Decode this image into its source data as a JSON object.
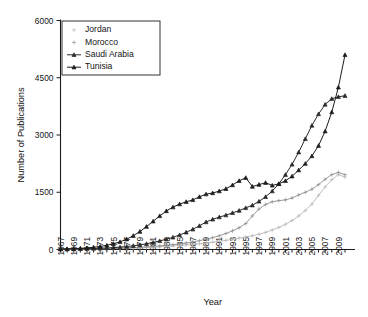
{
  "chart_data": {
    "type": "line",
    "title": "",
    "xlabel": "Year",
    "ylabel": "Number of Publications",
    "xlim": [
      1967,
      2010
    ],
    "ylim": [
      0,
      6000
    ],
    "grid": false,
    "legend_position": "top-left",
    "ytick_labels": [
      "0",
      "1500",
      "3000",
      "4500",
      "6000"
    ],
    "ytick_values": [
      0,
      1500,
      3000,
      4500,
      6000
    ],
    "xtick_labels": [
      "1967",
      "1969",
      "1971",
      "1973",
      "1975",
      "1977",
      "1979",
      "1981",
      "1983",
      "1985",
      "1987",
      "1989",
      "1991",
      "1993",
      "1995",
      "1997",
      "1999",
      "2001",
      "2003",
      "2005",
      "2007",
      "2009"
    ],
    "xtick_values": [
      1967,
      1969,
      1971,
      1973,
      1975,
      1977,
      1979,
      1981,
      1983,
      1985,
      1987,
      1989,
      1991,
      1993,
      1995,
      1997,
      1999,
      2001,
      2003,
      2005,
      2007,
      2009
    ],
    "x": [
      1967,
      1968,
      1969,
      1970,
      1971,
      1972,
      1973,
      1974,
      1975,
      1976,
      1977,
      1978,
      1979,
      1980,
      1981,
      1982,
      1983,
      1984,
      1985,
      1986,
      1987,
      1988,
      1989,
      1990,
      1991,
      1992,
      1993,
      1994,
      1995,
      1996,
      1997,
      1998,
      1999,
      2000,
      2001,
      2002,
      2003,
      2004,
      2005,
      2006,
      2007,
      2008,
      2009,
      2010
    ],
    "series": [
      {
        "name": "Jordan",
        "color": "#b8b8b8",
        "marker": "plus",
        "values": [
          5,
          6,
          8,
          10,
          12,
          14,
          16,
          20,
          24,
          28,
          32,
          38,
          44,
          52,
          60,
          70,
          80,
          92,
          105,
          120,
          135,
          150,
          170,
          190,
          215,
          240,
          270,
          300,
          330,
          360,
          400,
          450,
          510,
          580,
          660,
          760,
          880,
          1020,
          1190,
          1420,
          1640,
          1830,
          1960,
          1900
        ]
      },
      {
        "name": "Morocco",
        "color": "#8f8f8f",
        "marker": "plus",
        "values": [
          8,
          10,
          12,
          14,
          17,
          20,
          24,
          28,
          33,
          38,
          45,
          52,
          60,
          70,
          82,
          95,
          110,
          128,
          148,
          172,
          200,
          232,
          268,
          310,
          360,
          420,
          490,
          570,
          680,
          880,
          1060,
          1180,
          1250,
          1280,
          1300,
          1350,
          1430,
          1500,
          1580,
          1700,
          1840,
          1960,
          2020,
          1960
        ]
      },
      {
        "name": "Saudi Arabia",
        "color": "#2b2b2b",
        "marker": "triangle",
        "values": [
          10,
          12,
          15,
          18,
          22,
          26,
          32,
          40,
          50,
          62,
          78,
          98,
          120,
          150,
          185,
          225,
          270,
          320,
          380,
          450,
          530,
          620,
          720,
          790,
          850,
          900,
          960,
          1020,
          1090,
          1160,
          1260,
          1380,
          1530,
          1720,
          1960,
          2230,
          2550,
          2900,
          3250,
          3550,
          3800,
          3950,
          4000,
          4030
        ]
      },
      {
        "name": "Tunisia",
        "color": "#1c1c1c",
        "marker": "triangle",
        "values": [
          12,
          16,
          22,
          30,
          42,
          58,
          80,
          110,
          150,
          200,
          270,
          360,
          470,
          600,
          740,
          880,
          1010,
          1110,
          1190,
          1250,
          1300,
          1380,
          1450,
          1480,
          1530,
          1590,
          1690,
          1800,
          1880,
          1650,
          1700,
          1750,
          1680,
          1720,
          1800,
          1920,
          2080,
          2250,
          2450,
          2720,
          3100,
          3600,
          4250,
          5100
        ]
      }
    ]
  },
  "legend": {
    "items": [
      {
        "label": "Jordan"
      },
      {
        "label": "Morocco"
      },
      {
        "label": "Saudi Arabia"
      },
      {
        "label": "Tunisia"
      }
    ]
  },
  "axes": {
    "x_title": "Year",
    "y_title": "Number of Publications"
  }
}
